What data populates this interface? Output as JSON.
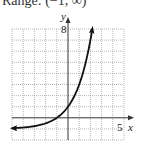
{
  "header": {
    "text": "Range: (−1, ∞)"
  },
  "chart_data": {
    "type": "line",
    "title": "",
    "xlabel": "x",
    "ylabel": "y",
    "xlim": [
      -5,
      5
    ],
    "ylim": [
      -2,
      8
    ],
    "grid": true,
    "x_tick_label": "5",
    "y_tick_label": "8",
    "series": [
      {
        "name": "f(x) = 2^(x+1) - 1",
        "x": [
          -5,
          -4,
          -3,
          -2,
          -1,
          0,
          1,
          1.5,
          2,
          2.17
        ],
        "y": [
          -0.94,
          -0.875,
          -0.75,
          -0.5,
          0,
          1,
          3,
          4.66,
          7,
          8
        ]
      }
    ],
    "colors": {
      "curve": "#111111",
      "grid": "#9a9a9a",
      "axis": "#333333"
    }
  }
}
